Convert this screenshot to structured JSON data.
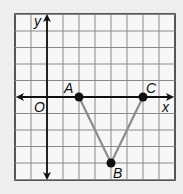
{
  "diagram": {
    "type": "coordinate-grid",
    "grid": {
      "cols": 10,
      "rows": 10,
      "x_min": -2,
      "x_max": 8,
      "y_min": -5,
      "y_max": 5
    },
    "axes": {
      "x_label": "x",
      "y_label": "y",
      "origin_label": "O"
    },
    "points": [
      {
        "name": "A",
        "x": 2,
        "y": 0
      },
      {
        "name": "B",
        "x": 4,
        "y": -4
      },
      {
        "name": "C",
        "x": 6,
        "y": 0
      }
    ],
    "segments": [
      [
        "A",
        "B"
      ],
      [
        "B",
        "C"
      ]
    ],
    "colors": {
      "background": "#eeeeee",
      "grid_fill": "#f7f7f7",
      "grid_line": "#888888",
      "segment": "#8c8c8c",
      "point": "#111111"
    }
  }
}
